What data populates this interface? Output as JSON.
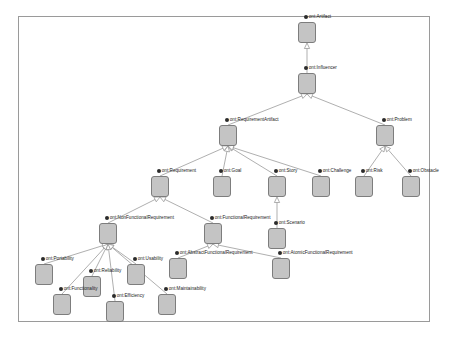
{
  "diagram": {
    "type": "uml-class-generalization-tree",
    "edge_color": "#8c8c8c",
    "node_fill": "#c4c4c4",
    "node_stroke": "#7d7d7d",
    "frame_stroke": "#9a9a9a",
    "background": "#ffffff",
    "arrowhead": "hollow-triangle-generalization",
    "nodes": [
      {
        "id": "artifact",
        "label": "ont:Artifact",
        "x": 307,
        "y": 22,
        "label_anchor": "left"
      },
      {
        "id": "influencer",
        "label": "ont:Influencer",
        "x": 307,
        "y": 73,
        "label_anchor": "left"
      },
      {
        "id": "reqartifact",
        "label": "ont:RequirementArtifact",
        "x": 228,
        "y": 125,
        "label_anchor": "left"
      },
      {
        "id": "problem",
        "label": "ont:Problem",
        "x": 385,
        "y": 125,
        "label_anchor": "left"
      },
      {
        "id": "requirement",
        "label": "ont:Requirement",
        "x": 160,
        "y": 176,
        "label_anchor": "left"
      },
      {
        "id": "goal",
        "label": "ont:Goal",
        "x": 222,
        "y": 176,
        "label_anchor": "left"
      },
      {
        "id": "story",
        "label": "ont:Story",
        "x": 277,
        "y": 176,
        "label_anchor": "left"
      },
      {
        "id": "challenge",
        "label": "ont:Challenge",
        "x": 321,
        "y": 176,
        "label_anchor": "left"
      },
      {
        "id": "risk",
        "label": "ont:Risk",
        "x": 364,
        "y": 176,
        "label_anchor": "left"
      },
      {
        "id": "obstacle",
        "label": "ont:Obstacle",
        "x": 411,
        "y": 176,
        "label_anchor": "left"
      },
      {
        "id": "nonfunctional",
        "label": "ont:NonFunctionalRequirement",
        "x": 108,
        "y": 223,
        "label_anchor": "left"
      },
      {
        "id": "functional",
        "label": "ont:FunctionalRequirement",
        "x": 213,
        "y": 223,
        "label_anchor": "left"
      },
      {
        "id": "scenario",
        "label": "ont:Scenario",
        "x": 277,
        "y": 228,
        "label_anchor": "left"
      },
      {
        "id": "portability",
        "label": "ont:Portability",
        "x": 44,
        "y": 264,
        "label_anchor": "left"
      },
      {
        "id": "reliability",
        "label": "ont:Reliability",
        "x": 92,
        "y": 276,
        "label_anchor": "left"
      },
      {
        "id": "usability",
        "label": "ont:Usability",
        "x": 136,
        "y": 264,
        "label_anchor": "left"
      },
      {
        "id": "functionality",
        "label": "ont:Functionality",
        "x": 62,
        "y": 294,
        "label_anchor": "left"
      },
      {
        "id": "efficiency",
        "label": "ont:Efficiency",
        "x": 115,
        "y": 301,
        "label_anchor": "left"
      },
      {
        "id": "maintainability",
        "label": "ont:Maintainability",
        "x": 167,
        "y": 294,
        "label_anchor": "left"
      },
      {
        "id": "abstractfunc",
        "label": "ont:AbstractFunctionalRequirement",
        "x": 178,
        "y": 258,
        "label_anchor": "left"
      },
      {
        "id": "atomicfunc",
        "label": "ont:AtomicFunctionalRequirement",
        "x": 281,
        "y": 258,
        "label_anchor": "left"
      }
    ],
    "edges": [
      {
        "from": "influencer",
        "to": "artifact"
      },
      {
        "from": "reqartifact",
        "to": "influencer"
      },
      {
        "from": "problem",
        "to": "influencer"
      },
      {
        "from": "requirement",
        "to": "reqartifact"
      },
      {
        "from": "goal",
        "to": "reqartifact"
      },
      {
        "from": "story",
        "to": "reqartifact"
      },
      {
        "from": "challenge",
        "to": "reqartifact"
      },
      {
        "from": "risk",
        "to": "problem"
      },
      {
        "from": "obstacle",
        "to": "problem"
      },
      {
        "from": "nonfunctional",
        "to": "requirement"
      },
      {
        "from": "functional",
        "to": "requirement"
      },
      {
        "from": "scenario",
        "to": "story"
      },
      {
        "from": "portability",
        "to": "nonfunctional"
      },
      {
        "from": "reliability",
        "to": "nonfunctional"
      },
      {
        "from": "usability",
        "to": "nonfunctional"
      },
      {
        "from": "functionality",
        "to": "nonfunctional"
      },
      {
        "from": "efficiency",
        "to": "nonfunctional"
      },
      {
        "from": "maintainability",
        "to": "nonfunctional"
      },
      {
        "from": "abstractfunc",
        "to": "functional"
      },
      {
        "from": "atomicfunc",
        "to": "functional"
      }
    ]
  }
}
